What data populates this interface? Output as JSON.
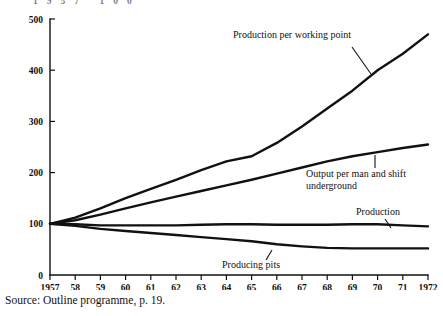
{
  "chart_data": {
    "type": "line",
    "title": "",
    "xlabel": "",
    "ylabel": "",
    "xlim": [
      1957,
      1972
    ],
    "ylim": [
      0,
      500
    ],
    "grid": false,
    "legend_position": "inline-annotations",
    "note": "Index series, 1957 = 100",
    "x": [
      1957,
      1958,
      1959,
      1960,
      1961,
      1962,
      1963,
      1964,
      1965,
      1966,
      1967,
      1968,
      1969,
      1970,
      1971,
      1972
    ],
    "x_tick_labels": [
      "1957",
      "58",
      "59",
      "60",
      "61",
      "62",
      "63",
      "64",
      "65",
      "66",
      "67",
      "68",
      "69",
      "70",
      "71",
      "1972"
    ],
    "y_tick_labels": [
      "0",
      "100",
      "200",
      "300",
      "400",
      "500"
    ],
    "y_ticks": [
      0,
      100,
      200,
      300,
      400,
      500
    ],
    "series": [
      {
        "name": "Production per working point",
        "label": "Production per working point",
        "values": [
          100,
          112,
          130,
          150,
          168,
          186,
          205,
          222,
          232,
          258,
          290,
          325,
          360,
          400,
          432,
          470
        ]
      },
      {
        "name": "Output per man and shift underground",
        "label": "Output per man and shift underground",
        "values": [
          100,
          107,
          118,
          130,
          142,
          153,
          164,
          175,
          186,
          198,
          210,
          222,
          232,
          240,
          248,
          255
        ]
      },
      {
        "name": "Production",
        "label": "Production",
        "values": [
          100,
          99,
          97,
          97,
          97,
          97,
          98,
          99,
          99,
          98,
          98,
          98,
          99,
          99,
          97,
          95
        ]
      },
      {
        "name": "Producing pits",
        "label": "Producing pits",
        "values": [
          100,
          96,
          90,
          86,
          82,
          78,
          74,
          70,
          66,
          60,
          56,
          53,
          52,
          52,
          52,
          52
        ]
      }
    ],
    "annotations": [
      {
        "text": "Production per working point",
        "text_x": 233,
        "text_y": 38,
        "leader_from_x": 352,
        "leader_from_y": 47,
        "leader_to_x": 371,
        "leader_to_y": 74
      },
      {
        "text": "Output per man and shift",
        "text_x": 306,
        "text_y": 177,
        "leader_from_x": 375,
        "leader_from_y": 155,
        "leader_to_x": 375,
        "leader_to_y": 168
      },
      {
        "text": "underground",
        "text_x": 306,
        "text_y": 189,
        "leader_from_x": null,
        "leader_from_y": null,
        "leader_to_x": null,
        "leader_to_y": null
      },
      {
        "text": "Production",
        "text_x": 356,
        "text_y": 215,
        "leader_from_x": 385,
        "leader_from_y": 219,
        "leader_to_x": 391,
        "leader_to_y": 228
      },
      {
        "text": "Producing pits",
        "text_x": 222,
        "text_y": 268,
        "leader_from_x": 266,
        "leader_from_y": 260,
        "leader_to_x": 272,
        "leader_to_y": 250
      }
    ]
  },
  "source": {
    "text": "Source: Outline programme, p. 19."
  },
  "cropped_header_artifact": {
    "text": "1957  100"
  },
  "colors": {
    "ink": "#111111",
    "background": "#ffffff"
  }
}
